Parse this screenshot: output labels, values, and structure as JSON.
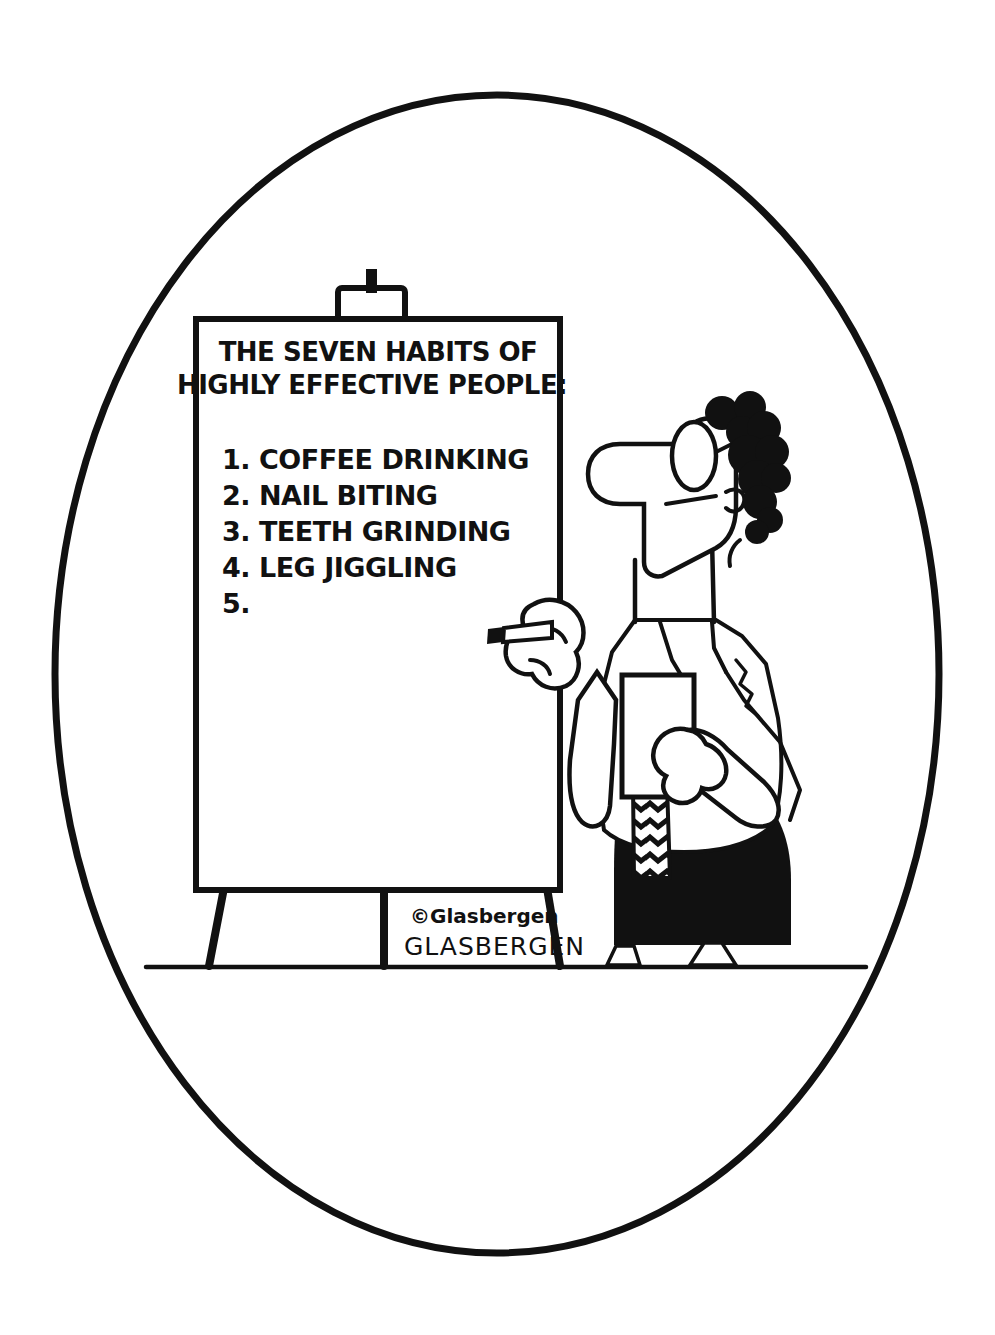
{
  "image": {
    "kind": "single-panel-cartoon",
    "medium": "black-and-white-line-drawing",
    "background_color": "#ffffff",
    "ink_color": "#111111",
    "frame_shape": "oval"
  },
  "flipchart": {
    "title_line_1": "THE SEVEN HABITS OF",
    "title_line_2": "HIGHLY EFFECTIVE PEOPLE:",
    "items": [
      "1. COFFEE DRINKING",
      "2. NAIL BITING",
      "3. TEETH GRINDING",
      "4. LEG JIGGLING",
      "5."
    ],
    "item_count_listed": 5,
    "items_blank": 1,
    "surface": "easel pad",
    "clip_present": true
  },
  "character": {
    "description": "businessman in profile facing left",
    "features": [
      "curly dark hair",
      "large rounded nose",
      "oval eyeglass lens",
      "white dress shirt",
      "zigzag striped necktie",
      "dark trousers",
      "white shoes"
    ],
    "props": [
      "marker held in raised hand",
      "notepad held against chest"
    ]
  },
  "signature": {
    "copyright": "©Glasbergen",
    "handwritten": "GLASBERGEN"
  },
  "scene": {
    "floor_line": true,
    "easel_legs": 3
  }
}
